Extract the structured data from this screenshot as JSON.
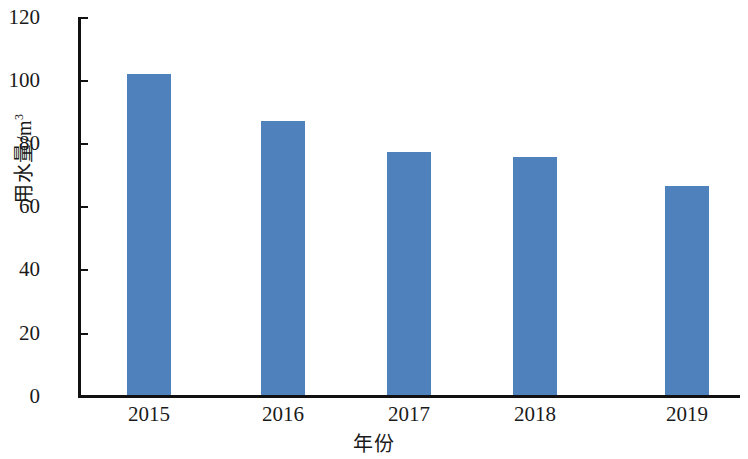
{
  "chart_data": {
    "type": "bar",
    "title": "",
    "subtitle": "",
    "categories": [
      "2015",
      "2016",
      "2017",
      "2018",
      "2019"
    ],
    "values": [
      102,
      87,
      77,
      75.5,
      66.5
    ],
    "series": [
      {
        "name": "用水量",
        "values": [
          102,
          87,
          77,
          75.5,
          66.5
        ]
      }
    ],
    "xlabel": "年份",
    "ylabel_main": "用水量/m",
    "ylabel_superscript": "3",
    "ylabel": "用水量/m³",
    "ylim": [
      0,
      120
    ],
    "yticks": [
      "0",
      "20",
      "40",
      "60",
      "80",
      "100",
      "120"
    ],
    "ytick_values": [
      0,
      20,
      40,
      60,
      80,
      100,
      120
    ],
    "grid": false,
    "legend": false,
    "legend_position": "none",
    "bar_color": "#4f81bd",
    "axis_color": "#111111",
    "background_color": "#ffffff"
  }
}
